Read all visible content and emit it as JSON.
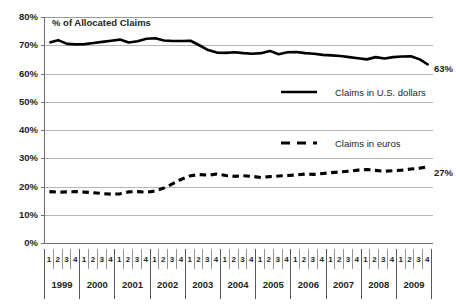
{
  "chart_data": {
    "type": "line",
    "title": "% of Allocated Claims",
    "xlabel": "",
    "ylabel": "",
    "ylim": [
      0,
      80
    ],
    "ytick_labels": [
      "80%",
      "70%",
      "60%",
      "50%",
      "40%",
      "30%",
      "20%",
      "10%",
      "0%"
    ],
    "ytick_values": [
      80,
      70,
      60,
      50,
      40,
      30,
      20,
      10,
      0
    ],
    "grid": true,
    "legend_position": "inside-right",
    "quarter_labels": [
      "1",
      "2",
      "3",
      "4"
    ],
    "years": [
      "1999",
      "2000",
      "2001",
      "2002",
      "2003",
      "2004",
      "2005",
      "2006",
      "2007",
      "2008",
      "2009"
    ],
    "categories": [
      "1999 Q1",
      "1999 Q2",
      "1999 Q3",
      "1999 Q4",
      "2000 Q1",
      "2000 Q2",
      "2000 Q3",
      "2000 Q4",
      "2001 Q1",
      "2001 Q2",
      "2001 Q3",
      "2001 Q4",
      "2002 Q1",
      "2002 Q2",
      "2002 Q3",
      "2002 Q4",
      "2003 Q1",
      "2003 Q2",
      "2003 Q3",
      "2003 Q4",
      "2004 Q1",
      "2004 Q2",
      "2004 Q3",
      "2004 Q4",
      "2005 Q1",
      "2005 Q2",
      "2005 Q3",
      "2005 Q4",
      "2006 Q1",
      "2006 Q2",
      "2006 Q3",
      "2006 Q4",
      "2007 Q1",
      "2007 Q2",
      "2007 Q3",
      "2007 Q4",
      "2008 Q1",
      "2008 Q2",
      "2008 Q3",
      "2008 Q4",
      "2009 Q1",
      "2009 Q2",
      "2009 Q3",
      "2009 Q4"
    ],
    "series": [
      {
        "name": "Claims in U.S. dollars",
        "style": "solid",
        "color": "#000000",
        "end_label": "63%",
        "values": [
          71.0,
          71.8,
          70.5,
          70.3,
          70.4,
          70.8,
          71.2,
          71.6,
          72.0,
          71.0,
          71.4,
          72.3,
          72.5,
          71.7,
          71.5,
          71.5,
          71.6,
          70.0,
          68.3,
          67.4,
          67.3,
          67.5,
          67.2,
          67.0,
          67.2,
          68.0,
          66.8,
          67.5,
          67.6,
          67.2,
          67.0,
          66.6,
          66.4,
          66.2,
          65.8,
          65.4,
          65.0,
          65.8,
          65.3,
          65.8,
          66.0,
          66.1,
          65.0,
          63.0
        ]
      },
      {
        "name": "Claims in euros",
        "style": "dashed",
        "color": "#000000",
        "end_label": "27%",
        "values": [
          18.2,
          18.0,
          18.1,
          18.2,
          18.0,
          17.8,
          17.5,
          17.3,
          17.4,
          18.1,
          18.2,
          18.0,
          18.4,
          19.5,
          21.0,
          22.6,
          23.8,
          24.2,
          24.0,
          24.4,
          23.9,
          23.6,
          23.8,
          23.6,
          23.2,
          23.5,
          23.7,
          23.9,
          24.1,
          24.4,
          24.3,
          24.6,
          24.9,
          25.2,
          25.4,
          25.8,
          26.0,
          25.7,
          25.4,
          25.6,
          25.8,
          26.2,
          26.5,
          27.0
        ]
      }
    ]
  },
  "legend": {
    "items": [
      {
        "label": "Claims in U.S. dollars",
        "style": "solid"
      },
      {
        "label": "Claims in euros",
        "style": "dashed"
      }
    ]
  },
  "annotations": {
    "usd_end": "63%",
    "eur_end": "27%"
  }
}
